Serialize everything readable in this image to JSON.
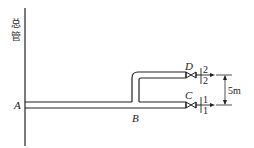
{
  "diagram": {
    "main_pipe_label": [
      "总",
      "管"
    ],
    "points": {
      "A": "A",
      "B": "B",
      "C": "C",
      "D": "D"
    },
    "sections": {
      "section_1_top": "1",
      "section_1_bottom": "1",
      "section_2_top": "2",
      "section_2_bottom": "2"
    },
    "dimension": "5m",
    "colors": {
      "line": "#222222",
      "background": "#ffffff"
    }
  }
}
